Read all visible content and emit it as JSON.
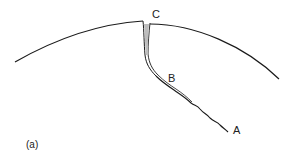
{
  "figure": {
    "panel_label": "(a)",
    "points": {
      "a": "A",
      "b": "B",
      "c": "C"
    },
    "elements": [
      {
        "name": "surface-arc",
        "description": "curved outer surface"
      },
      {
        "name": "crack",
        "description": "crack running from surface point C through B to tip A"
      }
    ],
    "colors": {
      "line": "#1a1a1a",
      "background": "#ffffff"
    }
  }
}
